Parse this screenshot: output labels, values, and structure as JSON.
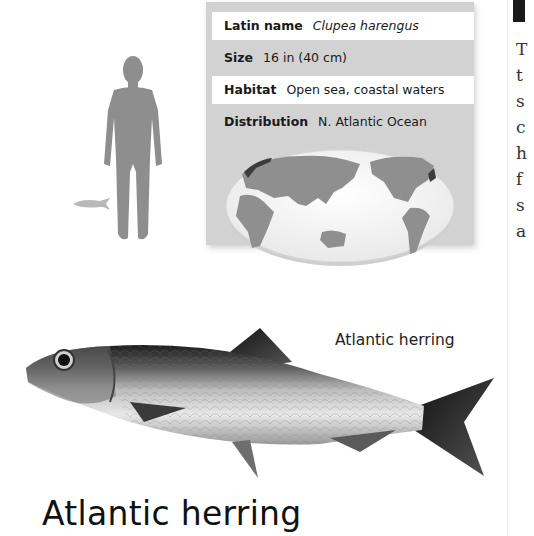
{
  "factfile": {
    "rows": [
      {
        "label": "Latin name",
        "value": "Clupea harengus",
        "italic": true
      },
      {
        "label": "Size",
        "value": "16 in (40 cm)"
      },
      {
        "label": "Habitat",
        "value": "Open sea, coastal waters"
      },
      {
        "label": "Distribution",
        "value": "N. Atlantic Ocean"
      }
    ]
  },
  "scale_comparison": {
    "human_icon": "human-silhouette-icon",
    "fish_icon": "fish-silhouette-icon"
  },
  "map": {
    "icon": "world-map-icon",
    "highlight_regions": [
      "North-east Atlantic coast",
      "North-west Atlantic coast"
    ]
  },
  "right_column": {
    "line_starts": [
      "T",
      "t",
      "s",
      "c",
      "h",
      "f",
      "s",
      "a"
    ]
  },
  "illustration": {
    "icon": "herring-illustration-icon",
    "caption": "Atlantic herring"
  },
  "title": "Atlantic herring",
  "colors": {
    "panel_bg": "#d2d2d2",
    "row_white": "#ffffff",
    "silhouette": "#8c8c8c",
    "map_land": "#8f8f8f"
  }
}
